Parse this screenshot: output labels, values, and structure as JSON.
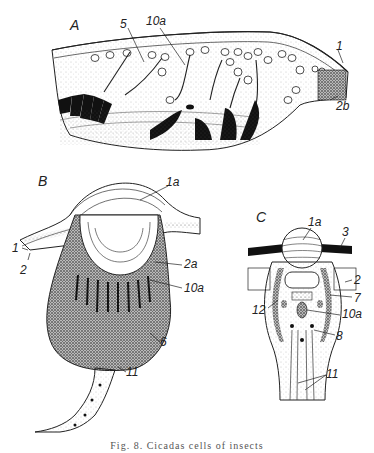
{
  "figure": {
    "caption": "Fig. 8.  Cicadas cells of insects",
    "panels": {
      "A": {
        "label": "A",
        "callouts": [
          "5",
          "10a",
          "1",
          "2b"
        ]
      },
      "B": {
        "label": "B",
        "callouts": [
          "1a",
          "1",
          "2",
          "2a",
          "10a",
          "6",
          "11"
        ]
      },
      "C": {
        "label": "C",
        "callouts": [
          "1a",
          "3",
          "2",
          "7",
          "12",
          "10a",
          "8",
          "11"
        ]
      }
    }
  }
}
